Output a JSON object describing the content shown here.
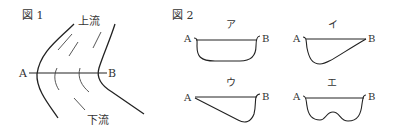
{
  "figure1": {
    "title": "図 1",
    "upstream": "上流",
    "downstream": "下流",
    "point_a": "A",
    "point_b": "B"
  },
  "figure2": {
    "title": "図 2",
    "panels": [
      {
        "label": "ア",
        "a": "A",
        "b": "B"
      },
      {
        "label": "イ",
        "a": "A",
        "b": "B"
      },
      {
        "label": "ウ",
        "a": "A",
        "b": "B"
      },
      {
        "label": "エ",
        "a": "A",
        "b": "B"
      }
    ]
  }
}
